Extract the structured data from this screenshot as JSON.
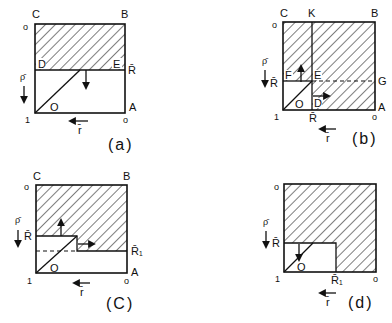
{
  "figure": {
    "panels": [
      {
        "id": "a",
        "caption": "(a)",
        "corners": {
          "C": "C",
          "B": "B",
          "A": "A"
        },
        "points": {
          "D": "D",
          "E": "E",
          "O": "O"
        },
        "axis": {
          "top_left": "o",
          "bottom_left": "1",
          "bottom_right": "o",
          "rho": "ρ̄",
          "r": "r̄",
          "R": "R̄"
        }
      },
      {
        "id": "b",
        "caption": "(b)",
        "corners": {
          "C": "C",
          "K": "K",
          "B": "B",
          "G": "G",
          "A": "A"
        },
        "points": {
          "F": "F",
          "E": "E",
          "O": "O",
          "D": "D"
        },
        "axis": {
          "top_left": "o",
          "bottom_left": "1",
          "bottom_right": "o",
          "rho": "ρ̄",
          "r": "r̄",
          "R_left": "R̄",
          "R_bottom": "R̄"
        }
      },
      {
        "id": "c",
        "caption": "(C)",
        "corners": {
          "C": "C",
          "B": "B",
          "A": "A"
        },
        "points": {
          "O": "O"
        },
        "axis": {
          "top_left": "o",
          "bottom_left": "1",
          "bottom_right": "o",
          "rho": "ρ̄",
          "r": "r̄",
          "R": "R̄",
          "R1": "R̄₁"
        }
      },
      {
        "id": "d",
        "caption": "(d)",
        "points": {
          "O": "O"
        },
        "axis": {
          "top_left": "o",
          "bottom_left": "1",
          "bottom_right": "o",
          "rho": "ρ̄",
          "r": "r̄",
          "R": "R̄",
          "R1": "R̄₁"
        }
      }
    ]
  }
}
